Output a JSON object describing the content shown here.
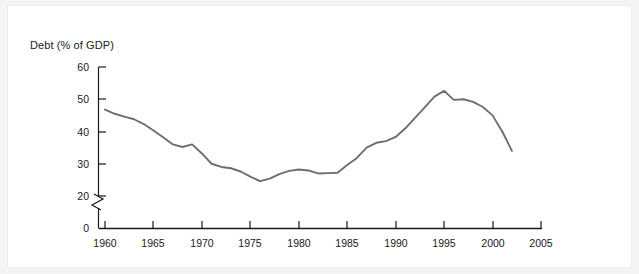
{
  "figure": {
    "background_color": "#ffffff",
    "outer_background_color": "#f4f4f4",
    "border_color": "#ededed"
  },
  "chart_data": {
    "type": "line",
    "title": "",
    "subtitle": "",
    "ylabel": "Debt (% of GDP)",
    "xlabel": "",
    "grid": false,
    "legend": null,
    "legend_position": "none",
    "line_color": "#6e6e6e",
    "axis_color": "#1a1a1a",
    "xlim": [
      1960,
      2005
    ],
    "ylim": [
      0,
      60
    ],
    "y_axis_break": {
      "present": true,
      "between": [
        0,
        20
      ],
      "style": "zigzag"
    },
    "xticks": [
      1960,
      1965,
      1970,
      1975,
      1980,
      1985,
      1990,
      1995,
      2000,
      2005
    ],
    "xtick_labels": [
      "1960",
      "1965",
      "1970",
      "1975",
      "1980",
      "1985",
      "1990",
      "1995",
      "2000",
      "2005"
    ],
    "yticks": [
      0,
      20,
      30,
      40,
      50,
      60
    ],
    "ytick_labels": [
      "0",
      "20",
      "30",
      "40",
      "50",
      "60"
    ],
    "series": [
      {
        "name": "Debt (% of GDP)",
        "color": "#6e6e6e",
        "x": [
          1960,
          1961,
          1962,
          1963,
          1964,
          1965,
          1966,
          1967,
          1968,
          1969,
          1970,
          1971,
          1972,
          1973,
          1974,
          1975,
          1976,
          1977,
          1978,
          1979,
          1980,
          1981,
          1982,
          1983,
          1984,
          1985,
          1986,
          1987,
          1988,
          1989,
          1990,
          1991,
          1992,
          1993,
          1994,
          1995,
          1996,
          1997,
          1998,
          1999,
          2000,
          2001,
          2002
        ],
        "values": [
          46.8,
          45.5,
          44.6,
          43.8,
          42.3,
          40.3,
          38.2,
          36.0,
          35.2,
          36.0,
          33.2,
          30.0,
          29.0,
          28.6,
          27.6,
          26.0,
          24.6,
          25.4,
          26.8,
          27.8,
          28.2,
          27.9,
          27.0,
          27.1,
          27.2,
          29.6,
          31.8,
          35.0,
          36.5,
          37.0,
          38.3,
          41.0,
          44.2,
          47.5,
          50.8,
          52.6,
          49.8,
          50.0,
          49.2,
          47.6,
          45.0,
          40.0,
          34.0
        ]
      }
    ],
    "annotations": [
      {
        "text": "peak",
        "x": 1995,
        "y": 52.6,
        "visible": false
      },
      {
        "text": "trough",
        "x": 1976,
        "y": 24.6,
        "visible": false
      }
    ]
  }
}
